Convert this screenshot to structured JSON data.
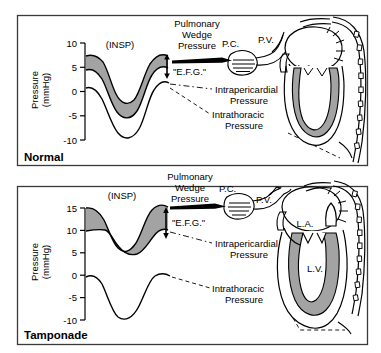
{
  "figure": {
    "title": "",
    "background_color": "#ffffff",
    "line_color": "#000000",
    "shade_color": "#a3a3a3",
    "panels": [
      {
        "name": "normal",
        "label": "Normal",
        "axis": {
          "title_line1": "Pressure",
          "title_line2": "(mmHg)",
          "ticks": [
            "10",
            "5",
            "0",
            "-5",
            "-10"
          ],
          "tick_values": [
            10,
            5,
            0,
            -5,
            -10
          ],
          "range": [
            -10,
            10
          ]
        },
        "waveform": {
          "inspiration_label": "(INSP)",
          "upper_curve_peak": 7,
          "upper_curve_trough": -3,
          "lower_curve_peak": 1,
          "lower_curve_trough": -9,
          "shaded_between": true,
          "curves_merged": true
        },
        "annotations": [
          {
            "name": "pulmonary-wedge-pressure",
            "lines": [
              "Pulmonary",
              "Wedge",
              "Pressure"
            ]
          },
          {
            "name": "efg",
            "lines": [
              "\"E.F.G.\""
            ]
          },
          {
            "name": "intrapericardial-pressure",
            "lines": [
              "Intrapericardial",
              "Pressure"
            ]
          },
          {
            "name": "intrathoracic-pressure",
            "lines": [
              "Intrathoracic",
              "Pressure"
            ]
          }
        ],
        "anatomy_labels": [
          {
            "name": "pulmonary-capillary",
            "text": "P.C."
          },
          {
            "name": "pulmonary-vein",
            "text": "P.V."
          },
          {
            "name": "left-atrium",
            "text": "L.A."
          }
        ]
      },
      {
        "name": "tamponade",
        "label": "Tamponade",
        "axis": {
          "title_line1": "Pressure",
          "title_line2": "(mmHg)",
          "ticks": [
            "15",
            "10",
            "5",
            "0",
            "-5",
            "-10"
          ],
          "tick_values": [
            15,
            10,
            5,
            0,
            -5,
            -10
          ],
          "range": [
            -10,
            15
          ]
        },
        "waveform": {
          "inspiration_label": "(INSP)",
          "upper_curve_peak": 15,
          "upper_curve_trough": 6,
          "lower_curve_peak": 10,
          "lower_curve_trough": 6,
          "intrathoracic_peak": 0,
          "intrathoracic_trough": -9,
          "shaded_between": true,
          "curves_merged": false
        },
        "annotations": [
          {
            "name": "pulmonary-wedge-pressure",
            "lines": [
              "Pulmonary",
              "Wedge",
              "Pressure"
            ]
          },
          {
            "name": "efg",
            "lines": [
              "\"E.F.G.\""
            ]
          },
          {
            "name": "intrapericardial-pressure",
            "lines": [
              "Intrapericardial",
              "Pressure"
            ]
          },
          {
            "name": "intrathoracic-pressure",
            "lines": [
              "Intrathoracic",
              "Pressure"
            ]
          }
        ],
        "anatomy_labels": [
          {
            "name": "pulmonary-capillary",
            "text": "P.C."
          },
          {
            "name": "pulmonary-vein",
            "text": "P.V."
          },
          {
            "name": "left-atrium",
            "text": "L.A."
          },
          {
            "name": "left-ventricle",
            "text": "L.V."
          }
        ]
      }
    ]
  }
}
